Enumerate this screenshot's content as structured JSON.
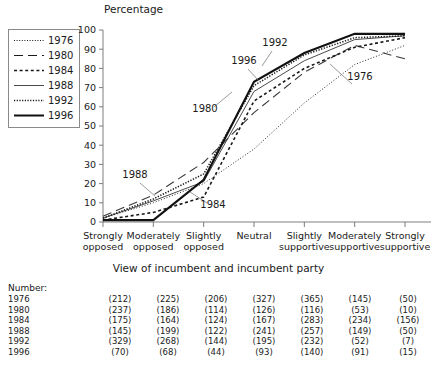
{
  "chart_data": {
    "type": "line",
    "title": "",
    "ylabel": "Percentage",
    "xlabel": "View of incumbent and incumbent party",
    "ylim": [
      0,
      100
    ],
    "ytick_step": 10,
    "yticks": [
      0,
      10,
      20,
      30,
      40,
      50,
      60,
      70,
      80,
      90,
      100
    ],
    "grid": false,
    "legend_position": "left-outside",
    "categories": [
      "Strongly opposed",
      "Moderately opposed",
      "Slightly opposed",
      "Neutral",
      "Slightly supportive",
      "Moderately supportive",
      "Strongly supportive"
    ],
    "series": [
      {
        "name": "1976",
        "style": "fine-dotted",
        "values": [
          2,
          10,
          20,
          38,
          62,
          82,
          92
        ]
      },
      {
        "name": "1980",
        "style": "long-dashed",
        "values": [
          3,
          14,
          31,
          57,
          78,
          92,
          85
        ]
      },
      {
        "name": "1984",
        "style": "short-dashed",
        "values": [
          1,
          5,
          13,
          63,
          80,
          91,
          96
        ]
      },
      {
        "name": "1988",
        "style": "thin-solid",
        "values": [
          2,
          11,
          21,
          68,
          84,
          95,
          97
        ]
      },
      {
        "name": "1992",
        "style": "dotted",
        "values": [
          2,
          12,
          25,
          71,
          87,
          96,
          97
        ]
      },
      {
        "name": "1996",
        "style": "thick-solid",
        "values": [
          1,
          1,
          22,
          73,
          88,
          98,
          98
        ]
      }
    ],
    "annotations": [
      {
        "label": "1976",
        "x": 360,
        "y": 80
      },
      {
        "label": "1980",
        "x": 205,
        "y": 112
      },
      {
        "label": "1984",
        "x": 213,
        "y": 208
      },
      {
        "label": "1988",
        "x": 135,
        "y": 178
      },
      {
        "label": "1992",
        "x": 275,
        "y": 46
      },
      {
        "label": "1996",
        "x": 244,
        "y": 64
      }
    ]
  },
  "legend": {
    "items": [
      {
        "label": "1976"
      },
      {
        "label": "1980"
      },
      {
        "label": "1984"
      },
      {
        "label": "1988"
      },
      {
        "label": "1992"
      },
      {
        "label": "1996"
      }
    ]
  },
  "number_table": {
    "heading": "Number:",
    "rows": [
      {
        "year": "1976",
        "values": [
          "(212)",
          "(225)",
          "(206)",
          "(327)",
          "(365)",
          "(145)",
          "(50)"
        ]
      },
      {
        "year": "1980",
        "values": [
          "(237)",
          "(186)",
          "(114)",
          "(126)",
          "(116)",
          "(53)",
          "(10)"
        ]
      },
      {
        "year": "1984",
        "values": [
          "(175)",
          "(164)",
          "(124)",
          "(167)",
          "(283)",
          "(234)",
          "(156)"
        ]
      },
      {
        "year": "1988",
        "values": [
          "(145)",
          "(199)",
          "(122)",
          "(241)",
          "(257)",
          "(149)",
          "(50)"
        ]
      },
      {
        "year": "1992",
        "values": [
          "(329)",
          "(268)",
          "(144)",
          "(195)",
          "(232)",
          "(52)",
          "(7)"
        ]
      },
      {
        "year": "1996",
        "values": [
          "(70)",
          "(68)",
          "(44)",
          "(93)",
          "(140)",
          "(91)",
          "(15)"
        ]
      }
    ]
  },
  "colors": {
    "ink": "#1a1a1a",
    "axis": "#6f6f6f",
    "background": "#ffffff"
  }
}
